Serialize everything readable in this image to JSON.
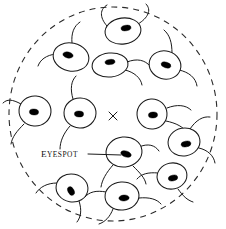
{
  "figure": {
    "background_color": "#ffffff",
    "ink_color": "#1a1a1a",
    "width": 226,
    "height": 229
  },
  "boundary": {
    "name": "dashed-boundary-circle",
    "style": "dashed",
    "color": "#2b2b2b",
    "center_x": 113,
    "center_y": 114,
    "radius_x": 104,
    "radius_y": 107,
    "dash_pattern": "6 5"
  },
  "center_marker": {
    "name": "light-source-x-mark",
    "glyph": "x",
    "x": 113,
    "y": 116,
    "size": 6,
    "color": "#1a1a1a"
  },
  "annotation": {
    "label_first_letter": "E",
    "label_rest": "YESPOT",
    "label_full": "Eyespot",
    "text_x": 41,
    "text_y": 157,
    "leader_from_x": 88,
    "leader_from_y": 154,
    "leader_to_x": 128,
    "leader_to_y": 155,
    "color": "#111111"
  },
  "organisms": [
    {
      "id": "cell-1",
      "name": "alga-top-center",
      "cx": 123,
      "cy": 31,
      "rx": 18,
      "ry": 13,
      "rotate": -8,
      "eye_dx": 3,
      "eye_dy": -3,
      "eye_rot": -8,
      "flagella": "upper-right"
    },
    {
      "id": "cell-2",
      "name": "alga-upper-left",
      "cx": 71,
      "cy": 57,
      "rx": 18,
      "ry": 14,
      "rotate": 12,
      "eye_dx": -3,
      "eye_dy": -2,
      "eye_rot": 12,
      "flagella": "upper-left"
    },
    {
      "id": "cell-3",
      "name": "alga-upper-mid",
      "cx": 110,
      "cy": 65,
      "rx": 18,
      "ry": 12,
      "rotate": -6,
      "eye_dx": 0,
      "eye_dy": -3,
      "eye_rot": -6,
      "flagella": "right"
    },
    {
      "id": "cell-4",
      "name": "alga-upper-right",
      "cx": 165,
      "cy": 65,
      "rx": 16,
      "ry": 14,
      "rotate": 16,
      "eye_dx": 1,
      "eye_dy": 0,
      "eye_rot": 16,
      "flagella": "upper-right"
    },
    {
      "id": "cell-5",
      "name": "alga-left-outer",
      "cx": 35,
      "cy": 111,
      "rx": 16,
      "ry": 15,
      "rotate": 4,
      "eye_dx": -1,
      "eye_dy": 1,
      "eye_rot": 4,
      "flagella": "left"
    },
    {
      "id": "cell-6",
      "name": "alga-left-inner",
      "cx": 80,
      "cy": 113,
      "rx": 16,
      "ry": 15,
      "rotate": 2,
      "eye_dx": -1,
      "eye_dy": 1,
      "eye_rot": 2,
      "flagella": "left-up"
    },
    {
      "id": "cell-7",
      "name": "alga-right-inner",
      "cx": 152,
      "cy": 114,
      "rx": 15,
      "ry": 15,
      "rotate": -4,
      "eye_dx": 1,
      "eye_dy": 1,
      "eye_rot": -4,
      "flagella": "right"
    },
    {
      "id": "cell-8",
      "name": "alga-right-outer",
      "cx": 184,
      "cy": 142,
      "rx": 16,
      "ry": 14,
      "rotate": -10,
      "eye_dx": 2,
      "eye_dy": 2,
      "eye_rot": -10,
      "flagella": "right-up"
    },
    {
      "id": "cell-9",
      "name": "alga-labeled-center",
      "cx": 124,
      "cy": 152,
      "rx": 18,
      "ry": 15,
      "rotate": -6,
      "eye_dx": 2,
      "eye_dy": 1,
      "eye_rot": 18,
      "flagella": "down-right",
      "labeled": true
    },
    {
      "id": "cell-10",
      "name": "alga-lower-left",
      "cx": 72,
      "cy": 188,
      "rx": 16,
      "ry": 14,
      "rotate": 10,
      "eye_dx": -1,
      "eye_dy": 3,
      "eye_rot": 14,
      "flagella": "left-down"
    },
    {
      "id": "cell-11",
      "name": "alga-bottom-center",
      "cx": 122,
      "cy": 196,
      "rx": 17,
      "ry": 14,
      "rotate": -4,
      "eye_dx": 2,
      "eye_dy": 2,
      "eye_rot": -4,
      "flagella": "down-left"
    },
    {
      "id": "cell-12",
      "name": "alga-lower-right",
      "cx": 172,
      "cy": 176,
      "rx": 15,
      "ry": 13,
      "rotate": -12,
      "eye_dx": 1,
      "eye_dy": 2,
      "eye_rot": -12,
      "flagella": "left-down"
    }
  ]
}
